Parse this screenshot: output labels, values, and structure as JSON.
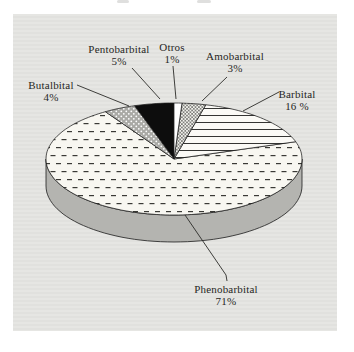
{
  "figure": {
    "panel_background": "#e4e4e1"
  },
  "chart_data": {
    "type": "pie",
    "style": "3d-exploded-none",
    "direction": "clockwise",
    "start_angle_deg": 0,
    "unit": "%",
    "legend_position": "callout-labels",
    "slices": [
      {
        "label": "Otros",
        "value": 1,
        "pct_label": "1%",
        "pattern": "solid-white"
      },
      {
        "label": "Amobarbital",
        "value": 3,
        "pct_label": "3%",
        "pattern": "crosshatch"
      },
      {
        "label": "Barbital",
        "value": 16,
        "pct_label": "16 %",
        "pattern": "horizontal-lines"
      },
      {
        "label": "Phenobarbital",
        "value": 71,
        "pct_label": "71%",
        "pattern": "dashes"
      },
      {
        "label": "Butalbital",
        "value": 4,
        "pct_label": "4%",
        "pattern": "dots-on-gray"
      },
      {
        "label": "Pentobarbital",
        "value": 5,
        "pct_label": "5%",
        "pattern": "solid-black"
      }
    ],
    "colors": {
      "side": "#b4b4b0",
      "outline": "#1c1c1c",
      "leader_line": "#2b2b28",
      "dash_background": "#f8f7f1",
      "dots_background": "#a9a9a5",
      "solid_black": "#0d0d0d",
      "solid_white": "#ffffff"
    }
  }
}
